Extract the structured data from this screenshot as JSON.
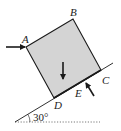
{
  "diagram": {
    "type": "block on inclined plane with forces",
    "labels": {
      "A": "A",
      "B": "B",
      "C": "C",
      "D": "D",
      "E": "E"
    },
    "angle_label": "30°",
    "colors": {
      "block_fill": "#d4d4d4",
      "stroke": "#1a1a1a",
      "dotted_line": "#555555"
    },
    "forces": [
      {
        "name": "horizontal-force-at-A",
        "direction": "right"
      },
      {
        "name": "weight-force",
        "direction": "down"
      },
      {
        "name": "force-at-E",
        "direction": "up-left, perpendicular to incline"
      }
    ]
  }
}
